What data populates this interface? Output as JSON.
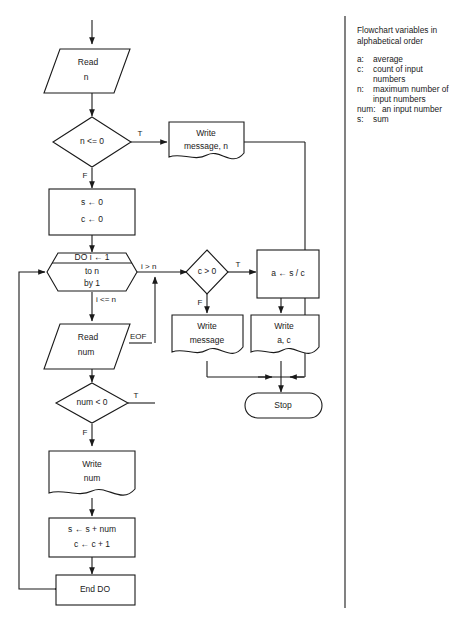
{
  "document": {
    "type": "flowchart",
    "background_color": "#ffffff",
    "ink_color": "#1a1a1a"
  },
  "flowchart": {
    "nodes": {
      "read_n": {
        "label_line1": "Read",
        "label_line2": "n",
        "shape": "parallelogram-input"
      },
      "test_n_le_0": {
        "label": "n   <= 0",
        "shape": "diamond-decision"
      },
      "write_message_n": {
        "label_line1": "Write",
        "label_line2": "message, n",
        "shape": "document-output"
      },
      "init": {
        "label_line1": "s ← 0",
        "label_line2": "c ← 0",
        "shape": "rectangle-process"
      },
      "do_loop": {
        "label_header": "DO  i ← 1",
        "label_line1": "to n",
        "label_line2": "by 1",
        "shape": "hexagon-loop"
      },
      "read_num": {
        "label_line1": "Read",
        "label_line2": "num",
        "shape": "parallelogram-input"
      },
      "test_num_lt_0": {
        "label": "num   <   0",
        "shape": "diamond-decision"
      },
      "write_num": {
        "label_line1": "Write",
        "label_line2": "num",
        "shape": "document-output"
      },
      "accumulate": {
        "label_line1": "s ← s + num",
        "label_line2": "c ← c + 1",
        "shape": "rectangle-process"
      },
      "end_do": {
        "label": "End DO",
        "shape": "rectangle-process"
      },
      "test_c_gt_0": {
        "label": "c   >   0",
        "shape": "diamond-decision"
      },
      "compute_average": {
        "label": "a ← s / c",
        "shape": "rectangle-process"
      },
      "write_message": {
        "label_line1": "Write",
        "label_line2": "message",
        "shape": "document-output"
      },
      "write_a_c": {
        "label_line1": "Write",
        "label_line2": "a, c",
        "shape": "document-output"
      },
      "stop": {
        "label": "Stop",
        "shape": "terminal-rounded"
      }
    },
    "edge_labels": {
      "n_le_0_true": "T",
      "n_le_0_false": "F",
      "do_exit": "i  >  n",
      "do_enter": "i   <= n",
      "read_num_eof": "EOF",
      "num_lt_0_true": "T",
      "num_lt_0_false": "F",
      "c_gt_0_true": "T",
      "c_gt_0_false": "F"
    }
  },
  "legend": {
    "title_line1": "Flowchart variables in",
    "title_line2": "alphabetical order",
    "entries": [
      {
        "key": "a:",
        "desc_line1": "average",
        "desc_line2": ""
      },
      {
        "key": "c:",
        "desc_line1": "count of input",
        "desc_line2": "numbers"
      },
      {
        "key": "n:",
        "desc_line1": "maximum number of",
        "desc_line2": "input numbers"
      },
      {
        "key": "num:",
        "desc_line1": "an input number",
        "desc_line2": ""
      },
      {
        "key": "s:",
        "desc_line1": "sum",
        "desc_line2": ""
      }
    ]
  }
}
